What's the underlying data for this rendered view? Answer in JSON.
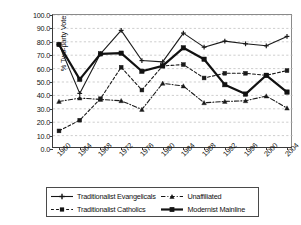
{
  "chart_data": {
    "type": "line",
    "title": "",
    "xlabel": "",
    "ylabel": "% Two-party Vote",
    "ylim": [
      0.0,
      100.0
    ],
    "ytick_step": 10.0,
    "grid": true,
    "grid_style": "horizontal dashed light gray",
    "legend_position": "bottom, boxed, two columns",
    "categories": [
      "1960",
      "1964",
      "1968",
      "1972",
      "1976",
      "1980",
      "1984",
      "1988",
      "1992",
      "1996",
      "2000",
      "2004"
    ],
    "ytick_labels": [
      "0.0",
      "10.0",
      "20.0",
      "30.0",
      "40.0",
      "50.0",
      "60.0",
      "70.0",
      "80.0",
      "90.0",
      "100.0"
    ],
    "series": [
      {
        "name": "Traditionalist Evangelicals",
        "color": "#1a1a1a",
        "marker": "plus",
        "dash": "solid",
        "width": 1.1,
        "values": [
          78.0,
          41.5,
          71.0,
          88.5,
          66.0,
          65.0,
          86.5,
          76.0,
          80.5,
          78.5,
          77.0,
          84.0
        ]
      },
      {
        "name": "Traditionalist Catholics",
        "color": "#1a1a1a",
        "marker": "square",
        "dash": "dashed",
        "width": 1.1,
        "values": [
          13.5,
          21.5,
          37.5,
          61.0,
          44.0,
          62.0,
          63.0,
          53.0,
          56.5,
          56.5,
          55.0,
          58.5
        ]
      },
      {
        "name": "Unaffiliated",
        "color": "#1a1a1a",
        "marker": "triangle",
        "dash": "dashdot",
        "width": 1.1,
        "values": [
          35.5,
          38.0,
          37.0,
          36.0,
          29.5,
          49.0,
          47.0,
          34.5,
          35.5,
          36.0,
          39.5,
          30.5
        ]
      },
      {
        "name": "Modernist Mainline",
        "color": "#111111",
        "marker": "square",
        "dash": "solid",
        "width": 2.2,
        "values": [
          78.0,
          52.0,
          71.0,
          71.5,
          58.0,
          62.0,
          75.5,
          67.0,
          48.0,
          41.0,
          55.0,
          42.5
        ]
      }
    ]
  },
  "legend": {
    "items": [
      {
        "label": "Traditionalist Evangelicals",
        "marker": "plus",
        "dash": "solid"
      },
      {
        "label": "Unaffiliated",
        "marker": "triangle",
        "dash": "dashdot"
      },
      {
        "label": "Traditionalist Catholics",
        "marker": "square",
        "dash": "dashed"
      },
      {
        "label": "Modernist Mainline",
        "marker": "square",
        "dash": "solid-thick"
      }
    ]
  }
}
